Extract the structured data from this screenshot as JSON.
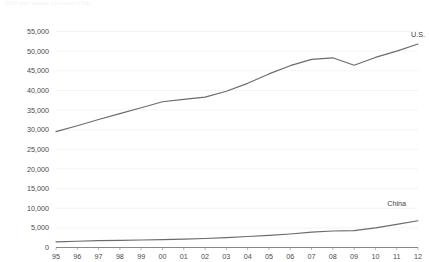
{
  "chart_data": {
    "type": "line",
    "title": "GDP per capita (current US$)",
    "xlabel": "",
    "ylabel": "",
    "x": [
      "95",
      "96",
      "97",
      "98",
      "99",
      "00",
      "01",
      "02",
      "03",
      "04",
      "05",
      "06",
      "07",
      "08",
      "09",
      "10",
      "11",
      "12"
    ],
    "x_full": [
      1995,
      1996,
      1997,
      1998,
      1999,
      2000,
      2001,
      2002,
      2003,
      2004,
      2005,
      2006,
      2007,
      2008,
      2009,
      2010,
      2011,
      2012
    ],
    "ylim": [
      0,
      55000
    ],
    "ytick_labels": [
      "0",
      "5,000",
      "10,000",
      "15,000",
      "20,000",
      "25,000",
      "30,000",
      "35,000",
      "40,000",
      "45,000",
      "50,000",
      "55,000"
    ],
    "ytick_values": [
      0,
      5000,
      10000,
      15000,
      20000,
      25000,
      30000,
      35000,
      40000,
      45000,
      50000,
      55000
    ],
    "grid": true,
    "legend_position": "inline-right",
    "series": [
      {
        "name": "U.S.",
        "color": "#6b6b6b",
        "label_x": "12",
        "label_value": 53500,
        "values": [
          29500,
          31000,
          32600,
          34100,
          35600,
          37100,
          37700,
          38300,
          39800,
          41800,
          44200,
          46300,
          47900,
          48300,
          46400,
          48400,
          50000,
          51800
        ]
      },
      {
        "name": "China",
        "color": "#6b6b6b",
        "label_x": "11",
        "label_value": 10500,
        "values": [
          1450,
          1600,
          1750,
          1830,
          1900,
          2000,
          2150,
          2300,
          2500,
          2800,
          3100,
          3450,
          3900,
          4200,
          4300,
          5000,
          5900,
          6800
        ]
      }
    ]
  }
}
